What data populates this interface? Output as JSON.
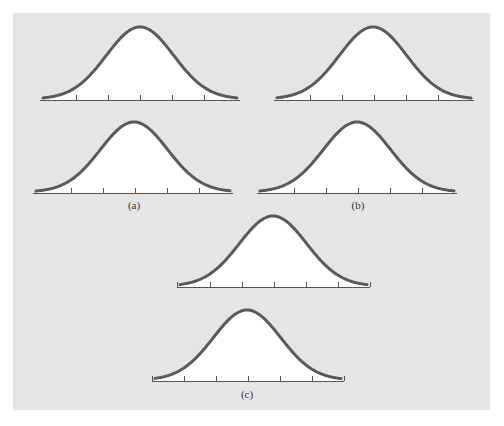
{
  "figure": {
    "background_color": "#e5e5e5",
    "curve_color": "#5a5a5a",
    "fill_color": "#ffffff",
    "axis_color": "#555555"
  },
  "labels": {
    "a": "(a)",
    "b": "(b)",
    "c": "(c)"
  },
  "chart_data": [
    {
      "type": "line",
      "group": "(a)",
      "position": "top",
      "title": "Normal curve",
      "x_axis": {
        "start": 40,
        "end": 240,
        "y": 100,
        "ticks": [
          76,
          108,
          140,
          172,
          204
        ]
      },
      "peak": {
        "x": 140,
        "y": 27
      },
      "sigma_px": 32,
      "description": "bell curve, mean at center tick, no tick labels"
    },
    {
      "type": "line",
      "group": "(a)",
      "position": "bottom",
      "title": "Normal curve",
      "x_axis": {
        "start": 33,
        "end": 233,
        "y": 193,
        "ticks": [
          71,
          103,
          135,
          167,
          199
        ]
      },
      "peak": {
        "x": 134,
        "y": 122
      },
      "sigma_px": 32,
      "description": "bell curve, mean at center tick, no tick labels"
    },
    {
      "type": "line",
      "group": "(b)",
      "position": "top",
      "title": "Normal curve",
      "x_axis": {
        "start": 274,
        "end": 474,
        "y": 100,
        "ticks": [
          310,
          342,
          374,
          406,
          438
        ]
      },
      "peak": {
        "x": 373,
        "y": 27
      },
      "sigma_px": 32,
      "description": "bell curve, mean at center tick, no tick labels"
    },
    {
      "type": "line",
      "group": "(b)",
      "position": "bottom",
      "title": "Normal curve",
      "x_axis": {
        "start": 257,
        "end": 457,
        "y": 193,
        "ticks": [
          294,
          326,
          358,
          390,
          422
        ]
      },
      "peak": {
        "x": 357,
        "y": 122
      },
      "sigma_px": 32,
      "description": "bell curve, mean at center tick, no tick labels"
    },
    {
      "type": "line",
      "group": "(c)",
      "position": "top",
      "title": "Normal curve",
      "x_axis": {
        "start": 177,
        "end": 370,
        "y": 287,
        "ticks": [
          177,
          210,
          242,
          274,
          306,
          338,
          370
        ]
      },
      "peak": {
        "x": 273,
        "y": 216
      },
      "sigma_px": 32,
      "description": "bell curve, mean at center tick, no tick labels"
    },
    {
      "type": "line",
      "group": "(c)",
      "position": "bottom",
      "title": "Normal curve",
      "x_axis": {
        "start": 152,
        "end": 344,
        "y": 381,
        "ticks": [
          152,
          184,
          216,
          248,
          280,
          312,
          344
        ]
      },
      "peak": {
        "x": 247,
        "y": 310
      },
      "sigma_px": 32,
      "description": "bell curve, mean at center tick, no tick labels"
    }
  ]
}
